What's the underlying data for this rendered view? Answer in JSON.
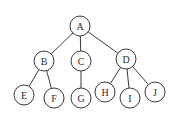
{
  "diagram": {
    "type": "tree",
    "radius": 10,
    "nodes": [
      {
        "id": "A",
        "label": "A",
        "x": 80,
        "y": 26
      },
      {
        "id": "B",
        "label": "B",
        "x": 44,
        "y": 61
      },
      {
        "id": "C",
        "label": "C",
        "x": 81,
        "y": 61
      },
      {
        "id": "D",
        "label": "D",
        "x": 126,
        "y": 59
      },
      {
        "id": "E",
        "label": "E",
        "x": 24,
        "y": 95
      },
      {
        "id": "F",
        "label": "F",
        "x": 54,
        "y": 98
      },
      {
        "id": "G",
        "label": "G",
        "x": 81,
        "y": 98
      },
      {
        "id": "H",
        "label": "H",
        "x": 105,
        "y": 92
      },
      {
        "id": "I",
        "label": "I",
        "x": 130,
        "y": 98
      },
      {
        "id": "J",
        "label": "J",
        "x": 155,
        "y": 92
      }
    ],
    "edges": [
      [
        "A",
        "B"
      ],
      [
        "A",
        "C"
      ],
      [
        "A",
        "D"
      ],
      [
        "B",
        "E"
      ],
      [
        "B",
        "F"
      ],
      [
        "C",
        "G"
      ],
      [
        "D",
        "H"
      ],
      [
        "D",
        "I"
      ],
      [
        "D",
        "J"
      ]
    ],
    "colors": {
      "stroke": "#3a3a3a",
      "text": "#2a2a2a",
      "fill": "#ffffff"
    }
  }
}
